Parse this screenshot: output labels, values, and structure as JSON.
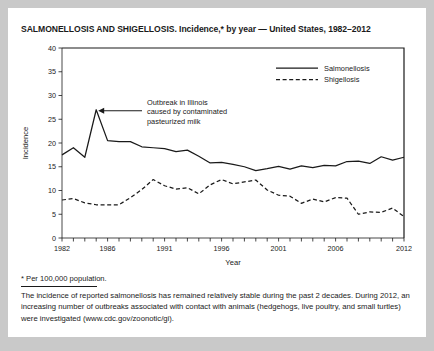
{
  "figure": {
    "title": "SALMONELLOSIS AND SHIGELLOSIS. Incidence,* by year — United States, 1982–2012"
  },
  "footnote": {
    "star": "* Per 100,000 population.",
    "body": "The incidence of reported salmonellosis has remained relatively stable during the past 2 decades. During 2012, an increasing number of outbreaks associated with contact with animals (hedgehogs, live poultry, and small turtles) were investigated (www.cdc.gov/zoonotic/gi)."
  },
  "annotation": {
    "line1": "Outbreak in Illinois",
    "line2": "caused by contaminated",
    "line3": "pasteurized milk"
  },
  "legend": {
    "position": "top-right",
    "items": [
      {
        "label": "Salmonellosis",
        "style": "solid"
      },
      {
        "label": "Shigellosis",
        "style": "dashed"
      }
    ]
  },
  "colors": {
    "ink": "#1a1a1a",
    "page": "#ffffff",
    "surround": "#c9c9c9"
  },
  "chart_data": {
    "type": "line",
    "title": "SALMONELLOSIS AND SHIGELLOSIS. Incidence,* by year — United States, 1982–2012",
    "xlabel": "Year",
    "ylabel": "Incidence",
    "xlim": [
      1982,
      2012
    ],
    "ylim": [
      0,
      40
    ],
    "yticks": [
      0,
      5,
      10,
      15,
      20,
      25,
      30,
      35,
      40
    ],
    "xticks_labeled": [
      1982,
      1986,
      1991,
      1996,
      2001,
      2006,
      2012
    ],
    "xticks_all": [
      1982,
      1983,
      1984,
      1985,
      1986,
      1987,
      1988,
      1989,
      1990,
      1991,
      1992,
      1993,
      1994,
      1995,
      1996,
      1997,
      1998,
      1999,
      2000,
      2001,
      2002,
      2003,
      2004,
      2005,
      2006,
      2007,
      2008,
      2009,
      2010,
      2011,
      2012
    ],
    "grid": false,
    "legend_position": "top-right",
    "x": [
      1982,
      1983,
      1984,
      1985,
      1986,
      1987,
      1988,
      1989,
      1990,
      1991,
      1992,
      1993,
      1994,
      1995,
      1996,
      1997,
      1998,
      1999,
      2000,
      2001,
      2002,
      2003,
      2004,
      2005,
      2006,
      2007,
      2008,
      2009,
      2010,
      2011,
      2012
    ],
    "series": [
      {
        "name": "Salmonellosis",
        "style": "solid",
        "values": [
          17.5,
          19.0,
          17.0,
          27.0,
          20.5,
          20.3,
          20.3,
          19.2,
          19.0,
          18.8,
          18.2,
          18.5,
          17.2,
          15.8,
          15.9,
          15.5,
          15.0,
          14.2,
          14.6,
          15.1,
          14.5,
          15.2,
          14.8,
          15.3,
          15.2,
          16.1,
          16.2,
          15.7,
          17.1,
          16.4,
          17.0
        ]
      },
      {
        "name": "Shigellosis",
        "style": "dashed",
        "values": [
          8.0,
          8.3,
          7.4,
          7.0,
          7.0,
          7.0,
          8.5,
          10.2,
          12.3,
          11.0,
          10.3,
          10.6,
          9.3,
          11.2,
          12.3,
          11.4,
          11.8,
          12.2,
          10.1,
          9.0,
          8.8,
          7.3,
          8.2,
          7.6,
          8.5,
          8.4,
          5.0,
          5.5,
          5.4,
          6.3,
          4.5
        ]
      }
    ],
    "annotations": [
      {
        "text": "Outbreak in Illinois caused by contaminated pasteurized milk",
        "points_to_year": 1985,
        "points_to_value": 27.0
      }
    ]
  }
}
